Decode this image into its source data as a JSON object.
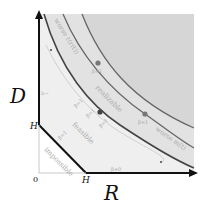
{
  "axes": {
    "x_label": "R",
    "y_label": "D",
    "origin": "0",
    "x_tick": "H",
    "y_tick": "H"
  },
  "regions": {
    "impossible": "impossible",
    "feasible": "feasible",
    "realizable": "realizable"
  },
  "curves": {
    "upper_label": "worse ℓ(r(t))",
    "right_label": "worse m(t)"
  },
  "annotations": {
    "beta_one_diag": "β=1",
    "beta_zero": "β=0",
    "beta_top": "β=1",
    "beta_mid_a": "β=1",
    "beta_mid_b": "β=1",
    "beta_mid_c": "β=1",
    "beta_right": "β=1",
    "left_marker": "b→"
  },
  "colors": {
    "shade": "#d9d9d9",
    "curve": "#555555",
    "axis": "#111111",
    "point": "#666666"
  }
}
